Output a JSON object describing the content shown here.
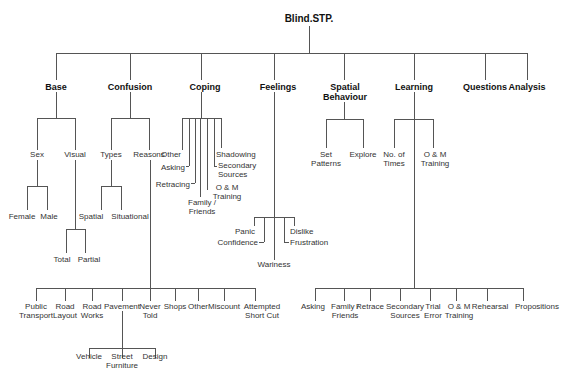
{
  "title": "Blind.STP.",
  "categories": {
    "base": "Base",
    "confusion": "Confusion",
    "coping": "Coping",
    "feelings": "Feelings",
    "spatial_behaviour": [
      "Spatial",
      "Behaviour"
    ],
    "learning": "Learning",
    "questions": "Questions",
    "analysis": "Analysis"
  },
  "base": {
    "sex": "Sex",
    "visual": "Visual",
    "sex_children": [
      "Female",
      "Male"
    ],
    "visual_children": [
      "Total",
      "Partial"
    ]
  },
  "confusion": {
    "types": "Types",
    "reasons": "Reasons",
    "types_children": [
      "Spatial",
      "Situational"
    ],
    "reasons_children": [
      [
        "Public",
        "Transport"
      ],
      [
        "Road",
        "Layout"
      ],
      [
        "Road",
        "Works"
      ],
      [
        "Pavement"
      ],
      [
        "Never",
        "Told"
      ],
      [
        "Shops"
      ],
      [
        "Other"
      ],
      [
        "Miscount"
      ],
      [
        "Attempted",
        "Short Cut"
      ]
    ],
    "pavement_children": [
      [
        "Vehicle"
      ],
      [
        "Street",
        "Furniture"
      ],
      [
        "Design"
      ]
    ]
  },
  "coping": {
    "children": {
      "other": "Other",
      "asking": "Asking",
      "retracing": "Retracing",
      "family_friends": [
        "Family /",
        "Friends"
      ],
      "om_training": [
        "O & M",
        "Training"
      ],
      "secondary_sources": [
        "Secondary",
        "Sources"
      ],
      "shadowing": "Shadowing"
    }
  },
  "feelings": {
    "children": {
      "panic": "Panic",
      "confidence": "Confidence",
      "wariness": "Wariness",
      "dislike": "Dislike",
      "frustration": "Frustration"
    }
  },
  "spatial_behaviour": {
    "children": [
      [
        "Set",
        "Patterns"
      ],
      [
        "Explore"
      ]
    ]
  },
  "learning": {
    "children": [
      [
        "No. of",
        "Times"
      ],
      [
        "O & M",
        "Training"
      ]
    ],
    "sub_children": [
      [
        "Asking"
      ],
      [
        "Family /",
        "Friends"
      ],
      [
        "Retrace"
      ],
      [
        "Secondary",
        "Sources"
      ],
      [
        "Trial",
        "Error"
      ],
      [
        "O & M",
        "Training"
      ],
      [
        "Rehearsal"
      ],
      [
        "Propositions"
      ]
    ]
  }
}
